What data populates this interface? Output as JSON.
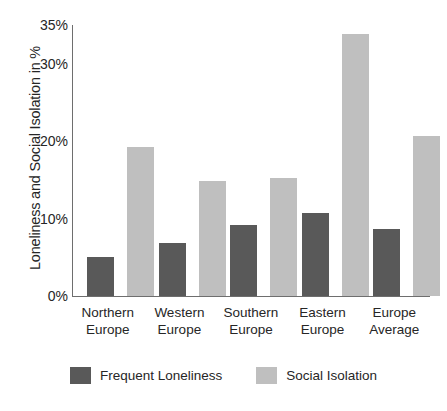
{
  "chart_data": {
    "type": "bar",
    "title": "",
    "subtitle": "",
    "xlabel": "",
    "ylabel": "Loneliness and Social Isolation in %",
    "categories": [
      "Northern Europe",
      "Western Europe",
      "Southern Europe",
      "Eastern Europe",
      "Europe Average"
    ],
    "category_lines": [
      [
        "Northern",
        "Europe"
      ],
      [
        "Western",
        "Europe"
      ],
      [
        "Southern",
        "Europe"
      ],
      [
        "Eastern",
        "Europe"
      ],
      [
        "Europe",
        "Average"
      ]
    ],
    "series": [
      {
        "name": "Frequent Loneliness",
        "color": "#595959",
        "values": [
          5.1,
          6.8,
          9.2,
          10.7,
          8.6
        ]
      },
      {
        "name": "Social Isolation",
        "color": "#bfbfbf",
        "values": [
          19.2,
          14.9,
          15.3,
          33.9,
          20.7
        ]
      }
    ],
    "ylim": [
      0,
      35
    ],
    "yticks": [
      0,
      10,
      20,
      30,
      35
    ],
    "ytick_labels": [
      "0%",
      "10%",
      "20%",
      "30%",
      "35%"
    ],
    "grid": false,
    "legend_position": "bottom",
    "axis_color": "#6e6e6e",
    "text_color": "#262626",
    "background": "#ffffff"
  }
}
